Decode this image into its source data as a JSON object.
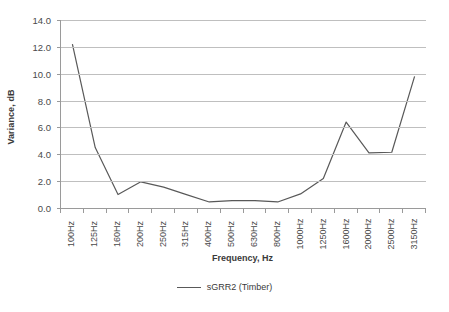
{
  "chart_data": {
    "type": "line",
    "title": "",
    "xlabel": "Frequency, Hz",
    "ylabel": "Variance, dB",
    "categories": [
      "100Hz",
      "125Hz",
      "160Hz",
      "200Hz",
      "250Hz",
      "315Hz",
      "400Hz",
      "500Hz",
      "630Hz",
      "800Hz",
      "1000Hz",
      "1250Hz",
      "1600Hz",
      "2000Hz",
      "2500Hz",
      "3150Hz"
    ],
    "series": [
      {
        "name": "sGRR2 (Timber)",
        "color": "#595959",
        "values": [
          12.2,
          4.5,
          1.0,
          1.95,
          1.55,
          1.0,
          0.45,
          0.55,
          0.55,
          0.45,
          1.05,
          2.2,
          6.4,
          4.1,
          4.15,
          9.8
        ]
      }
    ],
    "ylim": [
      0.0,
      14.0
    ],
    "ytick_step": 2.0,
    "ytick_labels": [
      "0.0",
      "2.0",
      "4.0",
      "6.0",
      "8.0",
      "10.0",
      "12.0",
      "14.0"
    ],
    "grid": true,
    "grid_axis": "y",
    "legend_position": "bottom",
    "legend_entries": [
      "sGRR2 (Timber)"
    ]
  },
  "colors": {
    "series_line": "#595959",
    "gridline": "#bfbfbf",
    "axis": "#9a9a9a",
    "text": "#3a3a3a",
    "background": "#ffffff"
  }
}
